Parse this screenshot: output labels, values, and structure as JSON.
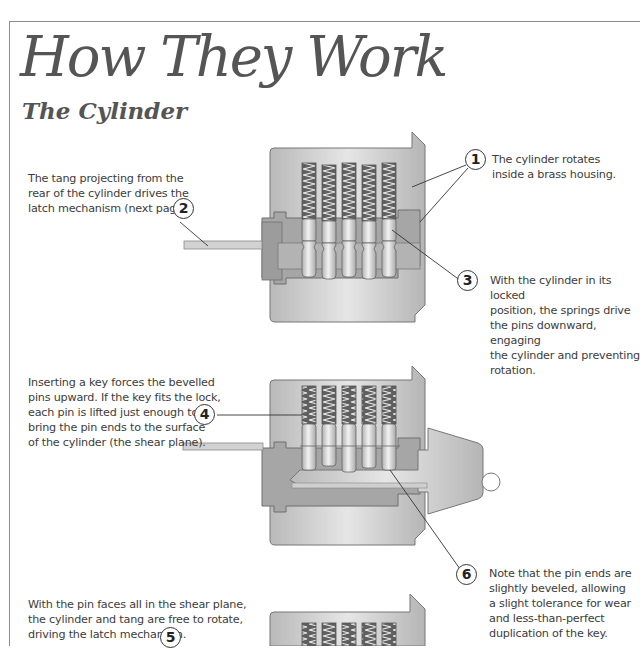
{
  "page": {
    "title": "How They Work",
    "subtitle": "The Cylinder"
  },
  "callouts": [
    {
      "number": "1",
      "text_lines": [
        "The cylinder rotates",
        "inside a brass housing."
      ]
    },
    {
      "number": "2",
      "text_lines": [
        "The tang projecting from the",
        "rear of the cylinder drives the",
        "latch mechanism (next page)."
      ]
    },
    {
      "number": "3",
      "text_lines": [
        "With the cylinder in its locked",
        "position, the springs drive",
        "the pins downward, engaging",
        "the cylinder and preventing",
        "rotation."
      ]
    },
    {
      "number": "4",
      "text_lines": [
        "Inserting a key forces the bevelled",
        "pins upward. If the key fits the lock,",
        "each pin is lifted just enough to",
        "bring the pin ends to the surface",
        "of the cylinder (the shear plane)."
      ]
    },
    {
      "number": "5",
      "text_lines": [
        "With the pin faces all in the shear plane,",
        "the cylinder and tang are free to rotate,",
        "driving the latch mechanism."
      ]
    },
    {
      "number": "6",
      "text_lines": [
        "Note that the pin ends are",
        "slightly beveled, allowing",
        "a slight tolerance for wear",
        "and less-than-perfect",
        "duplication of the key."
      ]
    }
  ],
  "diagrams": [
    {
      "label": "cylinder-locked",
      "pin_count": 5
    },
    {
      "label": "cylinder-with-key",
      "pin_count": 5
    },
    {
      "label": "cylinder-rotating",
      "pin_count": 5
    }
  ],
  "colors": {
    "housing": "#c8c8c8",
    "cylinder": "#a9a9a9",
    "spring": "#6e6e6e",
    "pin": "#d6d6d6",
    "outline": "#5a5a5a",
    "text": "#3c3c3c"
  }
}
